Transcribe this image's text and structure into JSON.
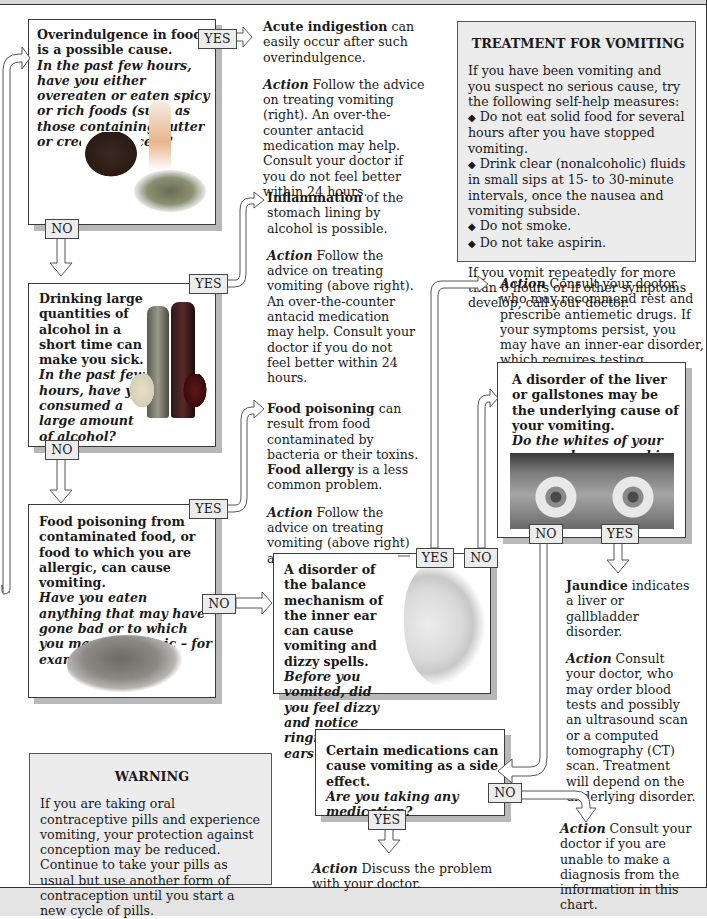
{
  "branch_labels": {
    "yes": "YES",
    "no": "NO"
  },
  "nodes": {
    "overindulgence": {
      "statement": "Overindulgence in food is a possible cause.",
      "question": "In the past few hours, have you either overeaten or eaten spicy or rich foods (such as those containing butter or creamy sauces)?",
      "image": "cake-and-ice-cream-photo"
    },
    "alcohol": {
      "statement": "Drinking large quantities of alcohol in a short time can make you sick.",
      "question": "In the past few hours, have you consumed a large amount of alcohol?",
      "image": "wine-bottles-and-glasses-photo"
    },
    "food_poisoning": {
      "statement": "Food poisoning from contaminated food, or food to which you are allergic, can cause vomiting.",
      "question": "Have you eaten anything that may have gone bad or to which you may be allergic – for example, shellfish?",
      "image": "shrimp-photo"
    },
    "inner_ear": {
      "statement": "A disorder of the balance mechanism of the inner ear can cause vomiting and dizzy spells.",
      "question": "Before you vomited, did you feel dizzy and notice ringing in your ears?",
      "image": "inner-ear-illustration"
    },
    "liver": {
      "statement": "A disorder of the liver or gallstones may be the underlying cause of your vomiting.",
      "question": "Do the whites of your eyes or does your skin look yellow?",
      "image": "eyes-photo"
    },
    "medications": {
      "statement": "Certain medications can cause vomiting as a side effect.",
      "question": "Are you taking any medication?"
    }
  },
  "outcomes": {
    "indigestion": {
      "bold": "Acute indigestion",
      "text": " can easily occur after such overindulgence.",
      "action_label": "Action",
      "action": " Follow the advice on treating vomiting (right). An over-the-counter antacid medication may help. Consult your doctor if you do not feel better within 24 hours."
    },
    "inflammation": {
      "bold": "Inflammation",
      "text": " of the stomach lining by alcohol is possible.",
      "action_label": "Action",
      "action": " Follow the advice on treating vomiting (above right). An over-the-counter antacid medication may help. Consult your doctor if you do not feel better within 24 hours."
    },
    "food_poisoning": {
      "bold": "Food poisoning",
      "text": " can result from food contaminated by bacteria or their toxins.",
      "bold2": "Food allergy",
      "text2": " is a less common problem.",
      "action_label": "Action",
      "action": " Follow the advice on treating vomiting (above right) and call your doctor."
    },
    "inner_ear": {
      "action_label": "Action",
      "action": " Consult your doctor, who may recommend rest and prescribe antiemetic drugs. If your symptoms persist, you may have an inner-ear disorder, which requires testing."
    },
    "jaundice": {
      "bold": "Jaundice",
      "text": " indicates a liver or gallbladder disorder.",
      "action_label": "Action",
      "action": " Consult your doctor, who may order blood tests and possibly an ultrasound scan or a computed tomography (CT) scan. Treatment will depend on the underlying disorder."
    },
    "medication": {
      "action_label": "Action",
      "action": " Discuss the problem with your doctor."
    },
    "undiagnosed": {
      "action_label": "Action",
      "action": " Consult your doctor if you are unable to make a diagnosis from the information in this chart."
    }
  },
  "treatment_box": {
    "title": "TREATMENT FOR VOMITING",
    "intro": "If you have been vomiting and you suspect no serious cause, try the following self-help measures:",
    "bullets": [
      "Do not eat solid food for several hours after you have stopped vomiting.",
      "Drink clear (nonalcoholic) fluids in small sips at 15- to 30-minute intervals, once the nausea and vomiting subside.",
      "Do not smoke.",
      "Do not take aspirin."
    ],
    "bullet_glyph": "◆",
    "closing": "If you vomit repeatedly for more than 6 hours or if other symptoms develop, call your doctor."
  },
  "warning_box": {
    "title": "WARNING",
    "text": "If you are taking oral contraceptive pills and experience vomiting, your protection against conception may be reduced. Continue to take your pills as usual but use another form of contraception until you start a new cycle of pills."
  },
  "colors": {
    "panel_gray": "#ececec",
    "shadow_gray": "#b8b8b8",
    "border": "#3a3a3a",
    "footer_band": "#e4e4e4"
  }
}
